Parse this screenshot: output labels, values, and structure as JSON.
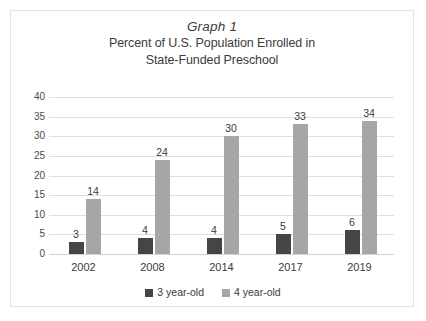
{
  "figure": {
    "title": "Graph 1",
    "subtitle_line_1": "Percent of U.S. Population Enrolled in",
    "subtitle_line_2": "State-Funded Preschool"
  },
  "colors": {
    "series_3_year_old": "#454545",
    "series_4_year_old": "#a6a6a6",
    "gridline": "#dedede",
    "frame_border": "#e2e2e2",
    "text": "#3b3b3b",
    "background": "#ffffff"
  },
  "legend": {
    "position": "bottom",
    "entries": [
      {
        "label": "3 year-old",
        "color": "#454545"
      },
      {
        "label": "4 year-old",
        "color": "#a6a6a6"
      }
    ]
  },
  "axis": {
    "y_ticks": [
      "0",
      "5",
      "10",
      "15",
      "20",
      "25",
      "30",
      "35",
      "40"
    ],
    "x_ticks": [
      "2002",
      "2008",
      "2014",
      "2017",
      "2019"
    ]
  },
  "chart_data": {
    "type": "bar",
    "xlabel": "",
    "ylabel": "",
    "ylim": [
      0,
      40
    ],
    "ytick_step": 5,
    "grid": true,
    "legend_position": "bottom",
    "categories": [
      "2002",
      "2008",
      "2014",
      "2017",
      "2019"
    ],
    "series": [
      {
        "name": "3 year-old",
        "color": "#454545",
        "values": [
          3,
          4,
          4,
          5,
          6
        ]
      },
      {
        "name": "4 year-old",
        "color": "#a6a6a6",
        "values": [
          14,
          24,
          30,
          33,
          34
        ]
      }
    ],
    "data_labels": {
      "3 year-old": [
        "3",
        "4",
        "4",
        "5",
        "6"
      ],
      "4 year-old": [
        "14",
        "24",
        "30",
        "33",
        "34"
      ]
    }
  }
}
